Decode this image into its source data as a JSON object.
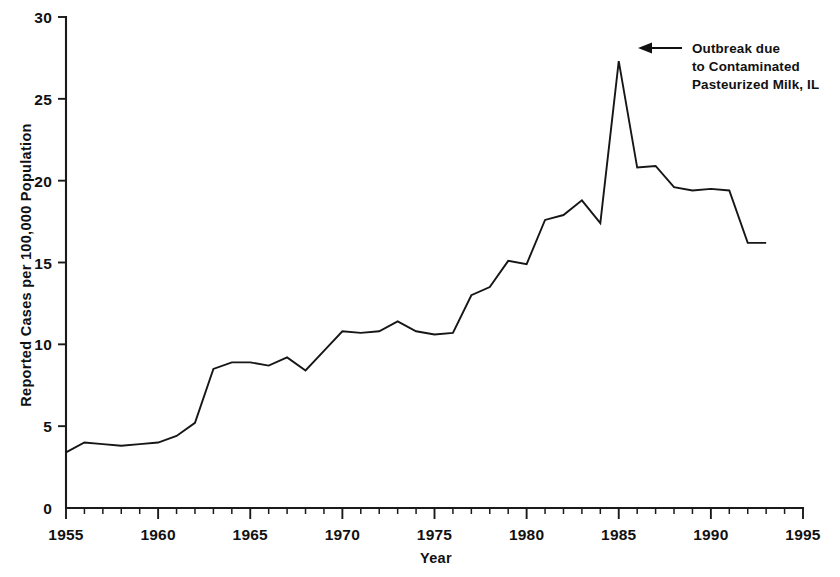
{
  "chart_data": {
    "type": "line",
    "title": "",
    "subtitle": "",
    "xlabel": "Year",
    "ylabel": "Reported Cases per 100,000 Population",
    "xlim": [
      1955,
      1995
    ],
    "ylim": [
      0,
      30
    ],
    "grid": false,
    "legend": "none",
    "x_tick_labels": [
      "1955",
      "1960",
      "1965",
      "1970",
      "1975",
      "1980",
      "1985",
      "1990",
      "1995"
    ],
    "x_tick_values": [
      1955,
      1960,
      1965,
      1970,
      1975,
      1980,
      1985,
      1990,
      1995
    ],
    "x_minor_tick_step": 1,
    "y_tick_labels": [
      "0",
      "5",
      "10",
      "15",
      "20",
      "25",
      "30"
    ],
    "y_tick_values": [
      0,
      5,
      10,
      15,
      20,
      25,
      30
    ],
    "x": [
      1955,
      1956,
      1957,
      1958,
      1959,
      1960,
      1961,
      1962,
      1963,
      1964,
      1965,
      1966,
      1967,
      1968,
      1969,
      1970,
      1971,
      1972,
      1973,
      1974,
      1975,
      1976,
      1977,
      1978,
      1979,
      1980,
      1981,
      1982,
      1983,
      1984,
      1985,
      1986,
      1987,
      1988,
      1989,
      1990,
      1991,
      1992,
      1993
    ],
    "values": [
      3.4,
      4.0,
      3.9,
      3.8,
      3.9,
      4.0,
      4.4,
      5.2,
      8.5,
      8.9,
      8.9,
      8.7,
      9.2,
      8.4,
      9.6,
      10.8,
      10.7,
      10.8,
      11.4,
      10.8,
      10.6,
      10.7,
      13.0,
      13.5,
      15.1,
      14.9,
      17.6,
      17.9,
      18.8,
      17.4,
      27.3,
      20.8,
      20.9,
      19.6,
      19.4,
      19.5,
      19.4,
      16.2,
      16.2
    ],
    "series": [
      {
        "name": "Reported cases per 100,000 population",
        "values": [
          3.4,
          4.0,
          3.9,
          3.8,
          3.9,
          4.0,
          4.4,
          5.2,
          8.5,
          8.9,
          8.9,
          8.7,
          9.2,
          8.4,
          9.6,
          10.8,
          10.7,
          10.8,
          11.4,
          10.8,
          10.6,
          10.7,
          13.0,
          13.5,
          15.1,
          14.9,
          17.6,
          17.9,
          18.8,
          17.4,
          27.3,
          20.8,
          20.9,
          19.6,
          19.4,
          19.5,
          19.4,
          16.2,
          16.2
        ]
      }
    ],
    "annotations": [
      {
        "name": "outbreak-annotation",
        "line1": "Outbreak due",
        "line2": "to Contaminated",
        "line3": "Pasteurized Milk, IL",
        "points_to_year": 1985,
        "points_to_value": 27.3,
        "arrow_direction": "left"
      }
    ],
    "colors": {
      "line": "#161616",
      "axis": "#1a1a1a",
      "text": "#111111",
      "background": "#ffffff"
    }
  }
}
